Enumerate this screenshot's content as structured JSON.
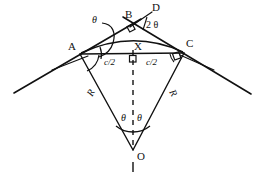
{
  "figure": {
    "type": "geometry-diagram",
    "background_color": "#ffffff",
    "stroke_color": "#111111"
  },
  "labels": {
    "point_a": "A",
    "point_b": "B",
    "point_c": "C",
    "point_d": "D",
    "point_x": "X",
    "point_o": "O",
    "theta_tangent": "θ",
    "theta_deflection": "2 θ",
    "theta_center_left": "θ",
    "theta_center_right": "θ",
    "half_chord_left": "c/2",
    "half_chord_right": "c/2",
    "radius_left": "R",
    "radius_right": "R"
  },
  "geometry": {
    "point_a": {
      "x": 80,
      "y": 53
    },
    "point_b": {
      "x": 133,
      "y": 24
    },
    "point_c": {
      "x": 183,
      "y": 52
    },
    "point_x": {
      "x": 133,
      "y": 57
    },
    "point_o": {
      "x": 133,
      "y": 150
    },
    "tangent_left_start": {
      "x": 14,
      "y": 93
    },
    "tangent_right_end": {
      "x": 251,
      "y": 94
    },
    "point_d_line_end": {
      "x": 152,
      "y": 13
    },
    "arc_apex": {
      "x": 133,
      "y": 38
    },
    "dashed_tail_end": {
      "x": 133,
      "y": 170
    }
  }
}
